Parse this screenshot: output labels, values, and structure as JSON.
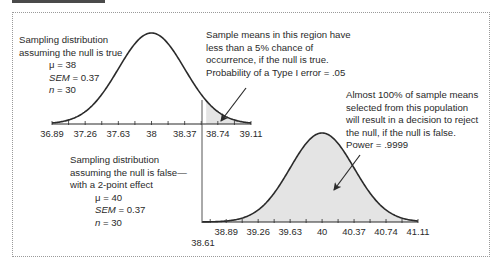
{
  "chart_data": [
    {
      "type": "area",
      "name": "null-true-distribution",
      "title": "Sampling distribution assuming the null is true",
      "params": {
        "mu": 38,
        "sem": 0.37,
        "n": 30
      },
      "x_ticks": [
        "36.89",
        "37.26",
        "37.63",
        "38",
        "38.37",
        "38.74",
        "39.11"
      ],
      "x_tick_values": [
        36.89,
        37.26,
        37.63,
        38,
        38.37,
        38.74,
        39.11
      ],
      "xlim": [
        36.89,
        39.11
      ],
      "shaded_region": {
        "from": 38.61,
        "to": 39.11,
        "meaning": "rejection region (alpha = .05)"
      }
    },
    {
      "type": "area",
      "name": "null-false-distribution",
      "title": "Sampling distribution assuming the null is false—with a 2-point effect",
      "params": {
        "mu": 40,
        "sem": 0.37,
        "n": 30
      },
      "x_ticks": [
        "38.89",
        "39.26",
        "39.63",
        "40",
        "40.37",
        "40.74",
        "41.11"
      ],
      "x_tick_values": [
        38.89,
        39.26,
        39.63,
        40,
        40.37,
        40.74,
        41.11
      ],
      "xlim": [
        38.61,
        41.11
      ],
      "critical_value_label": "38.61",
      "critical_value": 38.61,
      "shaded_region": {
        "from": 38.61,
        "to": 41.11,
        "meaning": "power"
      }
    }
  ],
  "labels": {
    "top_dist": {
      "line1": "Sampling distribution",
      "line2": "assuming the null is true",
      "mu": "μ = 38",
      "sem_sym": "SEM",
      "sem_val": " = 0.37",
      "n_sym": "n",
      "n_val": " = 30"
    },
    "bottom_dist": {
      "line1": "Sampling distribution",
      "line2": "assuming the null is false—",
      "line3": "with a 2-point effect",
      "mu": "μ = 40",
      "sem_sym": "SEM",
      "sem_val": " = 0.37",
      "n_sym": "n",
      "n_val": " = 30"
    },
    "alpha_note": [
      "Sample means in this region have",
      "less than a 5% chance of",
      "occurrence, if the null is true.",
      "Probability of a Type I error = .05"
    ],
    "power_note": [
      "Almost 100% of sample means",
      "selected from this population",
      "will result in a decision to reject",
      "the null, if the null is false.",
      "Power = .9999"
    ],
    "critical_value": "38.61"
  },
  "colors": {
    "curve": "#2b2b2b",
    "fill": "#e4e4e4",
    "text": "#2a2a2a",
    "border": "#9a9a9a"
  }
}
